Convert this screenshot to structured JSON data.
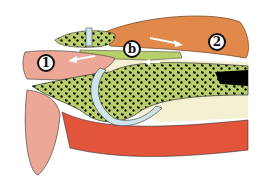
{
  "figure": {
    "type": "anatomical cross-section illustration",
    "labels": [
      {
        "id": "1",
        "text": "1",
        "x": 46,
        "y": 63
      },
      {
        "id": "b",
        "text": "b",
        "x": 132,
        "y": 49
      },
      {
        "id": "2",
        "text": "2",
        "x": 217,
        "y": 42
      }
    ],
    "arrows": [
      {
        "name": "arrow-right-upper",
        "direction": "right"
      },
      {
        "name": "arrow-left-middle",
        "direction": "left"
      },
      {
        "name": "arrow-left-lower",
        "direction": "left"
      }
    ],
    "colors": {
      "bone": "#b9cf6a",
      "bone_pores": "#111111",
      "tendon_orange": "#e0894a",
      "muscle_pink": "#eda796",
      "muscle_red": "#e2553a",
      "cartilage": "#cfe3ea",
      "fat_cream": "#f4f0d4",
      "marrow": "#000000"
    }
  }
}
